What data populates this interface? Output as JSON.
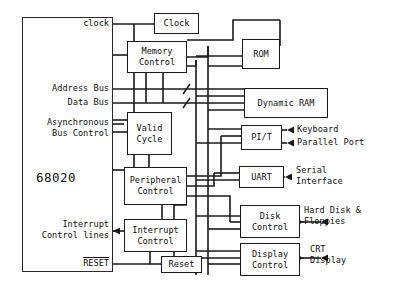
{
  "diagram": {
    "cpu": {
      "name": "68020"
    },
    "blocks": [
      {
        "id": "clock",
        "label": "Clock"
      },
      {
        "id": "memctl",
        "label": "Memory\nControl"
      },
      {
        "id": "validcycle",
        "label": "Valid\nCycle"
      },
      {
        "id": "periphctl",
        "label": "Peripheral\nControl"
      },
      {
        "id": "intctl",
        "label": "Interrupt\nControl"
      },
      {
        "id": "reset",
        "label": "Reset"
      },
      {
        "id": "rom",
        "label": "ROM"
      },
      {
        "id": "dram",
        "label": "Dynamic RAM"
      },
      {
        "id": "pit",
        "label": "PI/T"
      },
      {
        "id": "uart",
        "label": "UART"
      },
      {
        "id": "diskctl",
        "label": "Disk\nControl"
      },
      {
        "id": "dispctl",
        "label": "Display\nControl"
      }
    ],
    "cpu_pin_labels": [
      {
        "id": "clock-pin",
        "text": "clock"
      },
      {
        "id": "address-bus",
        "text": "Address Bus"
      },
      {
        "id": "data-bus",
        "text": "Data Bus"
      },
      {
        "id": "async-bus-ctrl",
        "text": "Asynchronous\nBus Control"
      },
      {
        "id": "interrupt-lines",
        "text": "Interrupt\nControl lines"
      },
      {
        "id": "reset-pin",
        "text": "RESET",
        "overline": true
      }
    ],
    "peripheral_labels": [
      {
        "id": "keyboard",
        "text": "Keyboard"
      },
      {
        "id": "parallel-port",
        "text": "Parallel Port"
      },
      {
        "id": "serial",
        "text": "Serial\nInterface"
      },
      {
        "id": "harddisk",
        "text": "Hard Disk &\nFloppies"
      },
      {
        "id": "crt",
        "text": "CRT\nDisplay"
      }
    ],
    "colors": {
      "line": "#1a1a1a",
      "background": "#ffffff",
      "text": "#111111"
    }
  }
}
